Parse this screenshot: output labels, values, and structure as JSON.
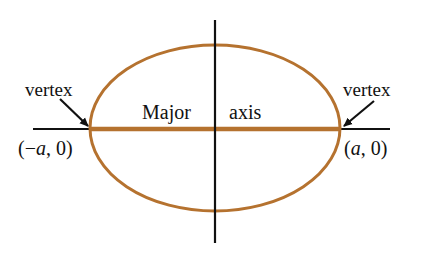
{
  "diagram": {
    "type": "ellipse-major-axis",
    "colors": {
      "ellipse": "#b5722f",
      "major_axis": "#b5722f",
      "axes": "#111111",
      "background": "#ffffff"
    },
    "ellipse": {
      "cx": 215,
      "cy": 128,
      "rx": 125,
      "ry": 83
    },
    "labels": {
      "major_left": "Major",
      "major_right": "axis",
      "vertex_left": "vertex",
      "vertex_right": "vertex",
      "point_left_open": "(−",
      "point_left_var": "a",
      "point_left_close": ", 0)",
      "point_right_open": "(",
      "point_right_var": "a",
      "point_right_close": ", 0)"
    }
  }
}
